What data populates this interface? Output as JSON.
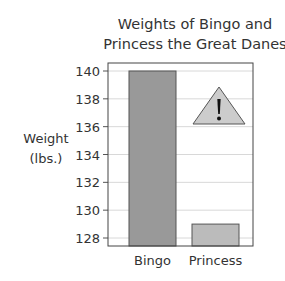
{
  "chart_data": {
    "type": "bar",
    "title": "Weights of Bingo and Princess the Great Danes",
    "title_lines": [
      "Weights of Bingo and",
      "Princess the Great Danes"
    ],
    "xlabel": "",
    "ylabel": "Weight (lbs.)",
    "ylabel_lines": [
      "Weight",
      "(lbs.)"
    ],
    "categories": [
      "Bingo",
      "Princess"
    ],
    "values": [
      140,
      129
    ],
    "ylim": [
      127.5,
      140.6
    ],
    "yticks": [
      128,
      130,
      132,
      134,
      136,
      138,
      140
    ],
    "grid": true,
    "legend": null,
    "annotations": [
      {
        "type": "warning-triangle",
        "text": "!"
      }
    ],
    "colors": {
      "Bingo": "#999999",
      "Princess": "#bbbbbb"
    }
  }
}
